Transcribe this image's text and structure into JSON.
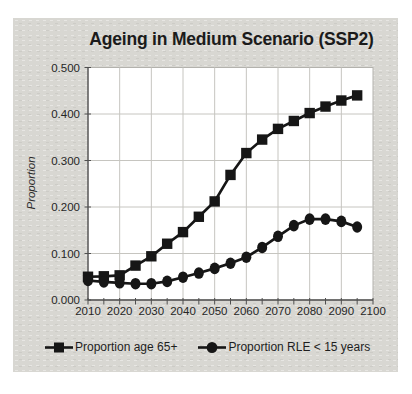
{
  "panel": {
    "background": "#d8d7d2"
  },
  "colors": {
    "ink": "#161616",
    "axis": "#4f4f4f",
    "grid": "#c6c5c0",
    "plot_border": "#b3b2ad",
    "tick_text": "#262626"
  },
  "chart_data": {
    "type": "line",
    "title": "Ageing in Medium Scenario (SSP2)",
    "xlabel": "",
    "ylabel": "Proportion",
    "x": [
      2010,
      2015,
      2020,
      2025,
      2030,
      2035,
      2040,
      2045,
      2050,
      2055,
      2060,
      2065,
      2070,
      2075,
      2080,
      2085,
      2090,
      2095
    ],
    "series": [
      {
        "name": "Proportion age 65+",
        "marker": "square",
        "values": [
          0.05,
          0.051,
          0.053,
          0.074,
          0.094,
          0.121,
          0.146,
          0.179,
          0.212,
          0.269,
          0.316,
          0.345,
          0.368,
          0.385,
          0.402,
          0.416,
          0.429,
          0.44
        ]
      },
      {
        "name": "Proportion RLE < 15 years",
        "marker": "circle",
        "values": [
          0.042,
          0.039,
          0.037,
          0.035,
          0.035,
          0.04,
          0.049,
          0.058,
          0.068,
          0.079,
          0.092,
          0.113,
          0.137,
          0.16,
          0.174,
          0.174,
          0.169,
          0.157
        ]
      }
    ],
    "xlim": [
      2010,
      2100
    ],
    "ylim": [
      0,
      0.5
    ],
    "x_ticks": [
      2010,
      2020,
      2030,
      2040,
      2050,
      2060,
      2070,
      2080,
      2090,
      2100
    ],
    "y_ticks": [
      "0.000",
      "0.100",
      "0.200",
      "0.300",
      "0.400",
      "0.500"
    ],
    "x_minor_tick_step": 5,
    "grid": true,
    "legend_position": "bottom"
  }
}
